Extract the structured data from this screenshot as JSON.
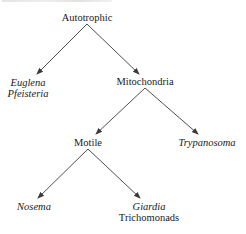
{
  "diagram": {
    "type": "tree",
    "nodes": {
      "root": {
        "label": "Autotrophic"
      },
      "left_leaf": {
        "lines": [
          "Euglena",
          "Pfeisteria"
        ],
        "italic": true
      },
      "mito": {
        "label": "Mitochondria"
      },
      "motile": {
        "label": "Motile"
      },
      "trypanosoma": {
        "label": "Trypanosoma",
        "italic": true
      },
      "nosema": {
        "label": "Nosema",
        "italic": true
      },
      "giardia_group": {
        "lines": [
          "Giardia",
          "Trichomonads"
        ],
        "italic_first": true
      }
    },
    "edges": [
      {
        "from": "Autotrophic",
        "to": "Euglena / Pfeisteria"
      },
      {
        "from": "Autotrophic",
        "to": "Mitochondria"
      },
      {
        "from": "Mitochondria",
        "to": "Motile"
      },
      {
        "from": "Mitochondria",
        "to": "Trypanosoma"
      },
      {
        "from": "Motile",
        "to": "Nosema"
      },
      {
        "from": "Motile",
        "to": "Giardia / Trichomonads"
      }
    ],
    "colors": {
      "line": "#3a3a3a",
      "text": "#1a1a1a",
      "background": "#ffffff"
    }
  }
}
